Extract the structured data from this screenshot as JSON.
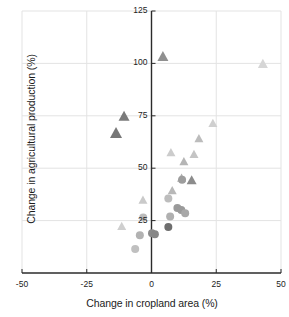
{
  "chart_data": {
    "type": "scatter",
    "title": "",
    "xlabel": "Change in cropland area (%)",
    "ylabel": "Change in agricultural production (%)",
    "xlim": [
      -50,
      50
    ],
    "ylim": [
      0,
      125
    ],
    "xticks": [
      -50,
      -25,
      0,
      25,
      50
    ],
    "xtick_labels": [
      "-50",
      "-25",
      "0",
      "25",
      "50"
    ],
    "yticks": [
      25,
      50,
      75,
      100,
      125
    ],
    "ytick_labels": [
      "25",
      "50",
      "75",
      "100",
      "125"
    ],
    "grid": true,
    "legend": "none",
    "markers": [
      "triangle",
      "circle"
    ],
    "series": [
      {
        "name": "triangles",
        "marker": "triangle",
        "points": [
          {
            "x": 4.4,
            "y": 103.5,
            "color": "#909090",
            "size": 11
          },
          {
            "x": 43.0,
            "y": 100.0,
            "color": "#d6d6d6",
            "size": 10
          },
          {
            "x": -10.6,
            "y": 75.0,
            "color": "#7a7a7a",
            "size": 11
          },
          {
            "x": -13.7,
            "y": 67.0,
            "color": "#777777",
            "size": 12
          },
          {
            "x": 23.7,
            "y": 71.6,
            "color": "#cfcfcf",
            "size": 9
          },
          {
            "x": 18.3,
            "y": 64.4,
            "color": "#bcbcbc",
            "size": 9
          },
          {
            "x": 7.5,
            "y": 57.7,
            "color": "#cccccc",
            "size": 9
          },
          {
            "x": 16.4,
            "y": 56.8,
            "color": "#c4c4c4",
            "size": 9
          },
          {
            "x": 12.5,
            "y": 53.4,
            "color": "#b5b5b5",
            "size": 9
          },
          {
            "x": 11.6,
            "y": 45.5,
            "color": "#b0b0b0",
            "size": 9
          },
          {
            "x": 15.5,
            "y": 44.5,
            "color": "#8c8c8c",
            "size": 10
          },
          {
            "x": 8.0,
            "y": 39.5,
            "color": "#b8b8b8",
            "size": 9
          },
          {
            "x": -3.3,
            "y": 35.0,
            "color": "#cacaca",
            "size": 9
          },
          {
            "x": -11.5,
            "y": 22.5,
            "color": "#cfcfcf",
            "size": 9
          }
        ]
      },
      {
        "name": "circles",
        "marker": "circle",
        "points": [
          {
            "x": 11.8,
            "y": 44.5,
            "color": "#9d9d9d",
            "size": 8
          },
          {
            "x": 6.5,
            "y": 35.5,
            "color": "#bdbdbd",
            "size": 8
          },
          {
            "x": 10.0,
            "y": 31.0,
            "color": "#9a9a9a",
            "size": 8
          },
          {
            "x": 11.5,
            "y": 30.0,
            "color": "#9a9a9a",
            "size": 8
          },
          {
            "x": 13.0,
            "y": 28.5,
            "color": "#a8a8a8",
            "size": 8
          },
          {
            "x": 7.2,
            "y": 27.0,
            "color": "#b0b0b0",
            "size": 8
          },
          {
            "x": -3.2,
            "y": 26.5,
            "color": "#bcbcbc",
            "size": 8
          },
          {
            "x": 6.5,
            "y": 22.0,
            "color": "#6e6e6e",
            "size": 8
          },
          {
            "x": 0.2,
            "y": 19.0,
            "color": "#8a8a8a",
            "size": 8
          },
          {
            "x": 1.3,
            "y": 18.5,
            "color": "#878787",
            "size": 8
          },
          {
            "x": -4.5,
            "y": 18.0,
            "color": "#b2b2b2",
            "size": 8
          },
          {
            "x": -6.3,
            "y": 11.5,
            "color": "#c0c0c0",
            "size": 8
          }
        ]
      }
    ]
  },
  "style": {
    "axis_color": "#2b2b2b",
    "grid_color": "#e3e3e3",
    "text_color": "#1c1c1c",
    "background": "#ffffff"
  }
}
